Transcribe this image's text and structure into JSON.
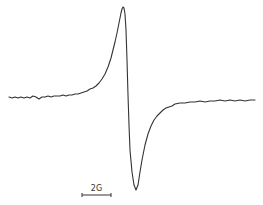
{
  "chart_data": {
    "type": "line",
    "title": "",
    "xlabel": "",
    "ylabel": "",
    "grid": false,
    "legend": null,
    "scale_bar": {
      "label": "2G",
      "x_start_px": 82,
      "x_end_px": 111,
      "y_px": 195
    },
    "annotations": [
      "2G"
    ],
    "series": [
      {
        "name": "EPR signal",
        "points_px": [
          [
            9,
            97
          ],
          [
            12,
            98
          ],
          [
            15,
            97
          ],
          [
            18,
            98
          ],
          [
            21,
            97
          ],
          [
            24,
            98
          ],
          [
            27,
            97
          ],
          [
            30,
            98
          ],
          [
            33,
            96
          ],
          [
            36,
            97
          ],
          [
            39,
            99
          ],
          [
            42,
            97
          ],
          [
            45,
            97
          ],
          [
            48,
            96
          ],
          [
            51,
            97
          ],
          [
            54,
            96
          ],
          [
            57,
            96
          ],
          [
            60,
            96
          ],
          [
            63,
            95
          ],
          [
            66,
            96
          ],
          [
            69,
            95
          ],
          [
            72,
            95
          ],
          [
            75,
            94
          ],
          [
            78,
            94
          ],
          [
            81,
            93
          ],
          [
            84,
            92
          ],
          [
            87,
            91
          ],
          [
            90,
            89
          ],
          [
            93,
            88
          ],
          [
            96,
            86
          ],
          [
            99,
            83
          ],
          [
            102,
            79
          ],
          [
            105,
            74
          ],
          [
            108,
            67
          ],
          [
            111,
            58
          ],
          [
            113,
            50
          ],
          [
            115,
            42
          ],
          [
            117,
            33
          ],
          [
            119,
            23
          ],
          [
            121,
            13
          ],
          [
            122,
            9
          ],
          [
            123,
            7
          ],
          [
            124,
            8
          ],
          [
            125,
            14
          ],
          [
            126,
            30
          ],
          [
            127,
            60
          ],
          [
            128,
            95
          ],
          [
            129,
            125
          ],
          [
            130,
            150
          ],
          [
            132,
            172
          ],
          [
            134,
            185
          ],
          [
            136,
            190
          ],
          [
            138,
            185
          ],
          [
            140,
            172
          ],
          [
            142,
            160
          ],
          [
            145,
            145
          ],
          [
            148,
            134
          ],
          [
            151,
            126
          ],
          [
            154,
            120
          ],
          [
            157,
            116
          ],
          [
            160,
            113
          ],
          [
            163,
            110
          ],
          [
            166,
            108
          ],
          [
            169,
            107
          ],
          [
            172,
            106
          ],
          [
            175,
            104
          ],
          [
            180,
            103
          ],
          [
            185,
            103
          ],
          [
            190,
            102
          ],
          [
            195,
            102
          ],
          [
            200,
            101
          ],
          [
            205,
            102
          ],
          [
            210,
            101
          ],
          [
            215,
            101
          ],
          [
            220,
            100
          ],
          [
            225,
            101
          ],
          [
            230,
            100
          ],
          [
            235,
            101
          ],
          [
            240,
            100
          ],
          [
            245,
            101
          ],
          [
            250,
            100
          ],
          [
            255,
            100
          ]
        ]
      }
    ],
    "features": {
      "peak_max_px": [
        123,
        7
      ],
      "peak_min_px": [
        136,
        190
      ],
      "baseline_y_px": 97,
      "zero_crossing_x_px": 128
    }
  },
  "scale": {
    "label": "2G"
  }
}
